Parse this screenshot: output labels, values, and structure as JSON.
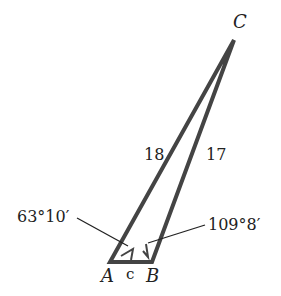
{
  "diagram": {
    "type": "triangle",
    "vertices": {
      "A": "A",
      "B": "B",
      "C": "C"
    },
    "sides": {
      "b_AC": "18",
      "a_BC": "17",
      "c_AB": "c"
    },
    "angles": {
      "A": "63°10′",
      "B": "109°8′"
    },
    "colors": {
      "stroke": "#444444",
      "text": "#222222"
    }
  }
}
